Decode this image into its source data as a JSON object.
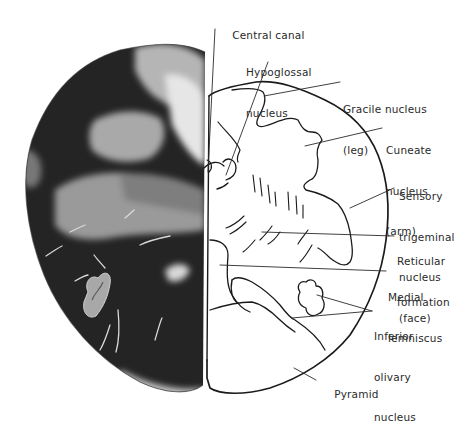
{
  "figure": {
    "colors": {
      "background": "#ffffff",
      "stain_dark": "#1e1e1e",
      "stain_light": "#b8b8b8",
      "line": "#1a1a1a",
      "text": "#2a2a2a"
    }
  },
  "labels": [
    {
      "id": "central-canal",
      "lines": [
        "Central canal"
      ],
      "x": 218,
      "y": 15
    },
    {
      "id": "hypoglossal-nucleus",
      "lines": [
        "Hypoglossal",
        "nucleus"
      ],
      "x": 246,
      "y": 40
    },
    {
      "id": "gracile-nucleus",
      "lines": [
        "Gracile nucleus",
        "(leg)"
      ],
      "x": 343,
      "y": 77
    },
    {
      "id": "cuneate-nucleus",
      "lines": [
        "Cuneate",
        "nucleus",
        "(arm)"
      ],
      "x": 386,
      "y": 118
    },
    {
      "id": "sensory-trigeminal-nucleus",
      "lines": [
        "Sensory",
        "trigeminal",
        "nucleus",
        "(face)"
      ],
      "x": 399,
      "y": 164
    },
    {
      "id": "reticular-formation",
      "lines": [
        "Reticular",
        "formation"
      ],
      "x": 397,
      "y": 228
    },
    {
      "id": "medial-lemniscus",
      "lines": [
        "Medial",
        "lemniscus"
      ],
      "x": 388,
      "y": 264
    },
    {
      "id": "inferior-olivary-nucleus",
      "lines": [
        "Inferior",
        "olivary",
        "nucleus"
      ],
      "x": 374,
      "y": 303
    },
    {
      "id": "pyramid",
      "lines": [
        "Pyramid"
      ],
      "x": 320,
      "y": 374
    }
  ]
}
